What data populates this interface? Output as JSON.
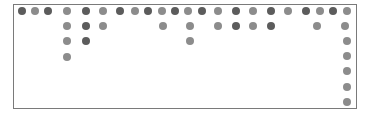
{
  "canvas": {
    "width": 371,
    "height": 117
  },
  "frame": {
    "left": 13,
    "top": 4,
    "right": 357,
    "bottom": 109,
    "border_color": "#7a7a7a"
  },
  "colors": {
    "dark": "#5c5c5c",
    "light": "#8c8c8c"
  },
  "dots": [
    {
      "x": 22,
      "y": 11,
      "s": "d"
    },
    {
      "x": 35,
      "y": 11,
      "s": "l"
    },
    {
      "x": 48,
      "y": 11,
      "s": "d"
    },
    {
      "x": 67,
      "y": 11,
      "s": "l"
    },
    {
      "x": 86,
      "y": 11,
      "s": "d"
    },
    {
      "x": 103,
      "y": 11,
      "s": "l"
    },
    {
      "x": 120,
      "y": 11,
      "s": "d"
    },
    {
      "x": 135,
      "y": 11,
      "s": "l"
    },
    {
      "x": 148,
      "y": 11,
      "s": "d"
    },
    {
      "x": 162,
      "y": 11,
      "s": "l"
    },
    {
      "x": 175,
      "y": 11,
      "s": "d"
    },
    {
      "x": 188,
      "y": 11,
      "s": "l"
    },
    {
      "x": 202,
      "y": 11,
      "s": "d"
    },
    {
      "x": 218,
      "y": 11,
      "s": "l"
    },
    {
      "x": 236,
      "y": 11,
      "s": "d"
    },
    {
      "x": 253,
      "y": 11,
      "s": "l"
    },
    {
      "x": 271,
      "y": 11,
      "s": "d"
    },
    {
      "x": 288,
      "y": 11,
      "s": "l"
    },
    {
      "x": 306,
      "y": 11,
      "s": "d"
    },
    {
      "x": 320,
      "y": 11,
      "s": "l"
    },
    {
      "x": 333,
      "y": 11,
      "s": "d"
    },
    {
      "x": 347,
      "y": 11,
      "s": "l"
    },
    {
      "x": 67,
      "y": 26,
      "s": "l"
    },
    {
      "x": 86,
      "y": 26,
      "s": "d"
    },
    {
      "x": 103,
      "y": 26,
      "s": "l"
    },
    {
      "x": 163,
      "y": 26,
      "s": "l"
    },
    {
      "x": 190,
      "y": 26,
      "s": "l"
    },
    {
      "x": 218,
      "y": 26,
      "s": "l"
    },
    {
      "x": 236,
      "y": 26,
      "s": "d"
    },
    {
      "x": 253,
      "y": 26,
      "s": "l"
    },
    {
      "x": 271,
      "y": 26,
      "s": "d"
    },
    {
      "x": 317,
      "y": 26,
      "s": "l"
    },
    {
      "x": 345,
      "y": 26,
      "s": "l"
    },
    {
      "x": 67,
      "y": 41,
      "s": "l"
    },
    {
      "x": 86,
      "y": 41,
      "s": "d"
    },
    {
      "x": 190,
      "y": 41,
      "s": "l"
    },
    {
      "x": 347,
      "y": 41,
      "s": "l"
    },
    {
      "x": 67,
      "y": 57,
      "s": "l"
    },
    {
      "x": 347,
      "y": 56,
      "s": "l"
    },
    {
      "x": 347,
      "y": 71,
      "s": "l"
    },
    {
      "x": 347,
      "y": 87,
      "s": "l"
    },
    {
      "x": 347,
      "y": 102,
      "s": "l"
    }
  ]
}
